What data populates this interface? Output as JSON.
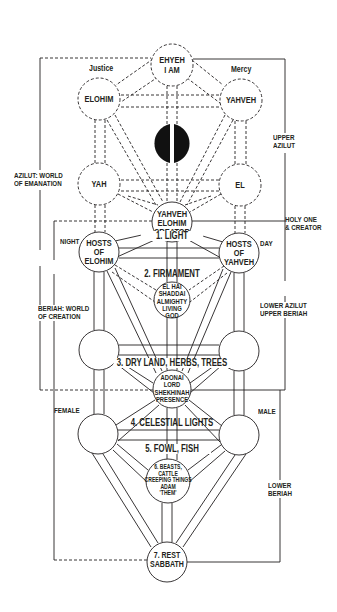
{
  "diagram": {
    "colors": {
      "ink": "#231f20",
      "background": "#ffffff"
    },
    "nodes": {
      "ehyeh": {
        "line1": "EHYEH",
        "line2": "I AM"
      },
      "elohim": {
        "label": "ELOHIM"
      },
      "yahveh_top": {
        "label": "YAHVEH"
      },
      "yah": {
        "label": "YAH"
      },
      "el": {
        "label": "EL"
      },
      "creator": {
        "line1": "YAHVEH",
        "line2": "ELOHIM",
        "line3": "CREATOR"
      },
      "hosts_elohim": {
        "line1": "HOSTS",
        "line2": "OF",
        "line3": "ELOHIM"
      },
      "hosts_yahveh": {
        "line1": "HOSTS",
        "line2": "OF",
        "line3": "YAHVEH"
      },
      "el_hai": {
        "line1": "EL HAI",
        "line2": "SHADDAI",
        "line3": "ALMIGHTY",
        "line4": "LIVING",
        "line5": "GOD"
      },
      "adonai": {
        "line1": "ADONAI",
        "line2": "LORD",
        "line3": "SHEKHINAH",
        "line4": "PRESENCE"
      },
      "beasts": {
        "line1": "6. BEASTS,",
        "line2": "CATTLE",
        "line3": "CREEPING THINGS",
        "line4": "ADAM",
        "line5": "'THEM'"
      },
      "sabbath": {
        "line1": "7. REST",
        "line2": "SABBATH"
      }
    },
    "path_labels": {
      "light": "1. LIGHT",
      "firmament": "2. FIRMAMENT",
      "dry_land": "3. DRY LAND, HERBS, TREES",
      "celestial": "4. CELESTIAL LIGHTS",
      "fowl": "5. FOWL, FISH"
    },
    "side_labels": {
      "justice": "Justice",
      "mercy": "Mercy",
      "upper_azilut": {
        "line1": "UPPER",
        "line2": "AZILUT"
      },
      "azilut_world": {
        "line1": "AZILUT: WORLD",
        "line2": "OF EMANATION"
      },
      "holy_one": {
        "line1": "HOLY ONE",
        "line2": "& CREATOR"
      },
      "night": "NIGHT",
      "day": "DAY",
      "beriah_world": {
        "line1": "BERIAH: WORLD",
        "line2": "OF CREATION"
      },
      "lower_azilut": {
        "line1": "LOWER AZILUT",
        "line2": "UPPER BERIAH"
      },
      "female": "FEMALE",
      "male": "MALE",
      "lower_beriah": {
        "line1": "LOWER",
        "line2": "BERIAH"
      }
    }
  }
}
